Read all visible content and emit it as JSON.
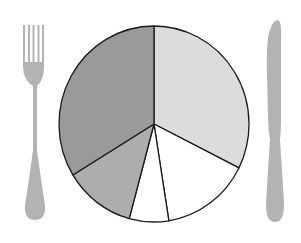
{
  "chart_data": {
    "type": "pie",
    "title": "",
    "start_angle_deg": 0,
    "direction": "clockwise",
    "categories": [
      "Slice A",
      "Slice B",
      "Slice C",
      "Slice D",
      "Slice E"
    ],
    "values": [
      32.4,
      15.1,
      6.7,
      12.1,
      33.7
    ],
    "colors": [
      "#dcdcdc",
      "#ffffff",
      "#ffffff",
      "#adadad",
      "#9a9a9a"
    ],
    "labels_visible": false,
    "legend": "none",
    "stroke_color": "#1a1a1a",
    "center": [
      154,
      124
    ],
    "radius": [
      95,
      98
    ]
  },
  "decorations": {
    "fork_color": "#b3b3b3",
    "knife_color": "#b3b3b3"
  }
}
